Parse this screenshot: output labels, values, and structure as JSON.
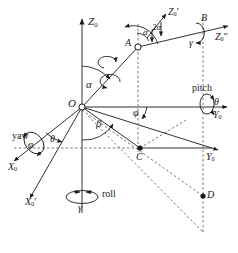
{
  "figure": {
    "type": "3d-coordinate-frame-diagram",
    "background_color": "#ffffff",
    "line_color": "#1a1a1a",
    "width": 238,
    "height": 253
  },
  "axes": [
    {
      "id": "z0",
      "label": "Z",
      "subscript": "0",
      "prime": "",
      "direction": "up",
      "style": "solid"
    },
    {
      "id": "z0_prime",
      "label": "Z",
      "subscript": "0",
      "prime": "′",
      "direction": "up-right",
      "style": "solid"
    },
    {
      "id": "z0_dprime",
      "label": "Z",
      "subscript": "0",
      "prime": "″",
      "direction": "right",
      "style": "solid"
    },
    {
      "id": "y0_upper",
      "label": "Y",
      "subscript": "0",
      "prime": "",
      "direction": "right",
      "style": "solid"
    },
    {
      "id": "y0_lower",
      "label": "Y",
      "subscript": "0",
      "prime": "",
      "direction": "right-down",
      "style": "solid"
    },
    {
      "id": "x0",
      "label": "X",
      "subscript": "0",
      "prime": "",
      "direction": "left-down",
      "style": "solid"
    },
    {
      "id": "x0_prime",
      "label": "X",
      "subscript": "0",
      "prime": "′",
      "direction": "left-down",
      "style": "solid"
    }
  ],
  "points": [
    {
      "id": "O",
      "label": "O",
      "marker": "open-circle"
    },
    {
      "id": "A",
      "label": "A",
      "marker": "open-circle"
    },
    {
      "id": "B",
      "label": "B",
      "marker": "none"
    },
    {
      "id": "C",
      "label": "C",
      "marker": "filled-dot"
    },
    {
      "id": "D",
      "label": "D",
      "marker": "filled-dot"
    }
  ],
  "angles": [
    {
      "id": "alpha_origin",
      "label": "α",
      "between": "Z0 and OA"
    },
    {
      "id": "alpha_at_a",
      "label": "α",
      "between": "Z0-prime and AB"
    },
    {
      "id": "two_alpha",
      "label": "2α",
      "between": "Z0-prime-axis and segment"
    },
    {
      "id": "beta",
      "label": "β",
      "between": "vertical and OC projection"
    },
    {
      "id": "phi_upper",
      "label": "φ",
      "between": "Y0 and OC"
    },
    {
      "id": "theta_origin",
      "label": "θ",
      "between": "X0 and X0-prime"
    },
    {
      "id": "gamma_at_b",
      "label": "γ",
      "between": "roll about Z0-double-prime"
    }
  ],
  "rotations": [
    {
      "id": "yaw",
      "name": "yaw",
      "symbol": "φ",
      "axis": "X0"
    },
    {
      "id": "pitch",
      "name": "pitch",
      "symbol": "θ",
      "axis": "Y0"
    },
    {
      "id": "roll",
      "name": "roll",
      "symbol": "γ",
      "axis": "Z0"
    }
  ],
  "labels": {
    "z0": {
      "base": "Z",
      "sub": "0",
      "prime": ""
    },
    "z0_prime": {
      "base": "Z",
      "sub": "0",
      "prime": "′"
    },
    "z0_dprime": {
      "base": "Z",
      "sub": "0",
      "prime": "″"
    },
    "y0_upper": {
      "base": "Y",
      "sub": "0",
      "prime": ""
    },
    "y0_lower": {
      "base": "Y",
      "sub": "0",
      "prime": ""
    },
    "x0": {
      "base": "X",
      "sub": "0",
      "prime": ""
    },
    "x0_prime": {
      "base": "X",
      "sub": "0",
      "prime": "′"
    },
    "point_O": "O",
    "point_A": "A",
    "point_B": "B",
    "point_C": "C",
    "point_D": "D",
    "alpha": "α",
    "alpha_a": "α",
    "two_alpha": "2α",
    "beta": "β",
    "gamma_roll": "γ",
    "gamma_b": "γ",
    "theta_origin": "θ",
    "theta_pitch": "θ",
    "phi_upper": "φ",
    "phi_yaw": "φ",
    "yaw": "yaw",
    "pitch": "pitch",
    "roll": "roll"
  }
}
